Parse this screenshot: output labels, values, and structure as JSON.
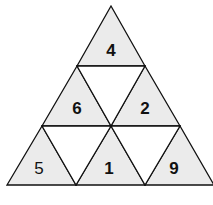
{
  "diagram": {
    "colors": {
      "shaded": "#ebebeb",
      "blank": "#ffffff",
      "stroke": "#111111"
    },
    "cells": [
      {
        "id": "top",
        "value": "4",
        "bold": true
      },
      {
        "id": "mid-left",
        "value": "6",
        "bold": true
      },
      {
        "id": "mid-center",
        "value": "",
        "bold": false
      },
      {
        "id": "mid-right",
        "value": "2",
        "bold": true
      },
      {
        "id": "bottom-left",
        "value": "5",
        "bold": false
      },
      {
        "id": "bottom-center-left",
        "value": "",
        "bold": false
      },
      {
        "id": "bottom-center",
        "value": "1",
        "bold": true
      },
      {
        "id": "bottom-center-right",
        "value": "",
        "bold": false
      },
      {
        "id": "bottom-right",
        "value": "9",
        "bold": true
      }
    ]
  }
}
